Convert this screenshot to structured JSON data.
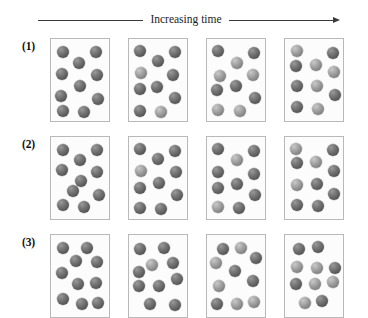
{
  "figure": {
    "time_axis": {
      "label": "Increasing time",
      "arrow_direction": "right"
    },
    "sphere_color_dark": "#5a5a5a",
    "sphere_color_light": "#969696",
    "box_border_color": "#b9b9b9",
    "rows": [
      {
        "label": "(1)",
        "frames": [
          {
            "particle_count": 10,
            "particles": [
              {
                "x": 6,
                "y": 7,
                "shade": "dark"
              },
              {
                "x": 39,
                "y": 7,
                "shade": "dark"
              },
              {
                "x": 22,
                "y": 18,
                "shade": "dark"
              },
              {
                "x": 5,
                "y": 29,
                "shade": "dark"
              },
              {
                "x": 40,
                "y": 30,
                "shade": "dark"
              },
              {
                "x": 23,
                "y": 41,
                "shade": "dark"
              },
              {
                "x": 4,
                "y": 51,
                "shade": "dark"
              },
              {
                "x": 41,
                "y": 54,
                "shade": "dark"
              },
              {
                "x": 6,
                "y": 66,
                "shade": "dark"
              },
              {
                "x": 27,
                "y": 67,
                "shade": "dark"
              }
            ]
          },
          {
            "particle_count": 10,
            "particles": [
              {
                "x": 5,
                "y": 6,
                "shade": "dark"
              },
              {
                "x": 40,
                "y": 7,
                "shade": "dark"
              },
              {
                "x": 23,
                "y": 16,
                "shade": "dark"
              },
              {
                "x": 6,
                "y": 28,
                "shade": "light"
              },
              {
                "x": 38,
                "y": 30,
                "shade": "dark"
              },
              {
                "x": 22,
                "y": 42,
                "shade": "dark"
              },
              {
                "x": 5,
                "y": 44,
                "shade": "dark"
              },
              {
                "x": 40,
                "y": 53,
                "shade": "dark"
              },
              {
                "x": 5,
                "y": 66,
                "shade": "dark"
              },
              {
                "x": 26,
                "y": 67,
                "shade": "light"
              }
            ]
          },
          {
            "particle_count": 10,
            "particles": [
              {
                "x": 5,
                "y": 6,
                "shade": "dark"
              },
              {
                "x": 41,
                "y": 8,
                "shade": "dark"
              },
              {
                "x": 24,
                "y": 18,
                "shade": "light"
              },
              {
                "x": 7,
                "y": 31,
                "shade": "light"
              },
              {
                "x": 40,
                "y": 30,
                "shade": "light"
              },
              {
                "x": 23,
                "y": 41,
                "shade": "dark"
              },
              {
                "x": 4,
                "y": 45,
                "shade": "dark"
              },
              {
                "x": 42,
                "y": 53,
                "shade": "dark"
              },
              {
                "x": 5,
                "y": 65,
                "shade": "light"
              },
              {
                "x": 27,
                "y": 66,
                "shade": "light"
              }
            ]
          },
          {
            "particle_count": 10,
            "particles": [
              {
                "x": 6,
                "y": 6,
                "shade": "light"
              },
              {
                "x": 42,
                "y": 8,
                "shade": "dark"
              },
              {
                "x": 5,
                "y": 21,
                "shade": "dark"
              },
              {
                "x": 25,
                "y": 20,
                "shade": "light"
              },
              {
                "x": 43,
                "y": 27,
                "shade": "light"
              },
              {
                "x": 6,
                "y": 41,
                "shade": "dark"
              },
              {
                "x": 26,
                "y": 41,
                "shade": "light"
              },
              {
                "x": 44,
                "y": 50,
                "shade": "dark"
              },
              {
                "x": 6,
                "y": 62,
                "shade": "dark"
              },
              {
                "x": 27,
                "y": 64,
                "shade": "light"
              }
            ]
          }
        ]
      },
      {
        "label": "(2)",
        "frames": [
          {
            "particle_count": 10,
            "particles": [
              {
                "x": 6,
                "y": 7,
                "shade": "dark"
              },
              {
                "x": 40,
                "y": 7,
                "shade": "dark"
              },
              {
                "x": 23,
                "y": 17,
                "shade": "dark"
              },
              {
                "x": 5,
                "y": 27,
                "shade": "dark"
              },
              {
                "x": 40,
                "y": 29,
                "shade": "dark"
              },
              {
                "x": 24,
                "y": 38,
                "shade": "dark"
              },
              {
                "x": 16,
                "y": 48,
                "shade": "dark"
              },
              {
                "x": 42,
                "y": 52,
                "shade": "dark"
              },
              {
                "x": 6,
                "y": 62,
                "shade": "dark"
              },
              {
                "x": 27,
                "y": 64,
                "shade": "dark"
              }
            ]
          },
          {
            "particle_count": 10,
            "particles": [
              {
                "x": 5,
                "y": 6,
                "shade": "dark"
              },
              {
                "x": 40,
                "y": 8,
                "shade": "dark"
              },
              {
                "x": 23,
                "y": 16,
                "shade": "dark"
              },
              {
                "x": 6,
                "y": 28,
                "shade": "light"
              },
              {
                "x": 41,
                "y": 29,
                "shade": "dark"
              },
              {
                "x": 24,
                "y": 40,
                "shade": "dark"
              },
              {
                "x": 5,
                "y": 45,
                "shade": "dark"
              },
              {
                "x": 42,
                "y": 52,
                "shade": "dark"
              },
              {
                "x": 5,
                "y": 65,
                "shade": "dark"
              },
              {
                "x": 26,
                "y": 66,
                "shade": "dark"
              }
            ]
          },
          {
            "particle_count": 10,
            "particles": [
              {
                "x": 5,
                "y": 6,
                "shade": "dark"
              },
              {
                "x": 41,
                "y": 8,
                "shade": "dark"
              },
              {
                "x": 24,
                "y": 17,
                "shade": "light"
              },
              {
                "x": 5,
                "y": 29,
                "shade": "dark"
              },
              {
                "x": 41,
                "y": 31,
                "shade": "dark"
              },
              {
                "x": 24,
                "y": 41,
                "shade": "dark"
              },
              {
                "x": 5,
                "y": 45,
                "shade": "dark"
              },
              {
                "x": 42,
                "y": 52,
                "shade": "dark"
              },
              {
                "x": 5,
                "y": 64,
                "shade": "light"
              },
              {
                "x": 26,
                "y": 65,
                "shade": "dark"
              }
            ]
          },
          {
            "particle_count": 10,
            "particles": [
              {
                "x": 5,
                "y": 6,
                "shade": "light"
              },
              {
                "x": 42,
                "y": 7,
                "shade": "dark"
              },
              {
                "x": 6,
                "y": 20,
                "shade": "dark"
              },
              {
                "x": 25,
                "y": 19,
                "shade": "light"
              },
              {
                "x": 43,
                "y": 28,
                "shade": "dark"
              },
              {
                "x": 6,
                "y": 42,
                "shade": "light"
              },
              {
                "x": 26,
                "y": 41,
                "shade": "dark"
              },
              {
                "x": 43,
                "y": 51,
                "shade": "dark"
              },
              {
                "x": 6,
                "y": 62,
                "shade": "dark"
              },
              {
                "x": 27,
                "y": 63,
                "shade": "dark"
              }
            ]
          }
        ]
      },
      {
        "label": "(3)",
        "frames": [
          {
            "particle_count": 10,
            "particles": [
              {
                "x": 6,
                "y": 7,
                "shade": "dark"
              },
              {
                "x": 30,
                "y": 7,
                "shade": "dark"
              },
              {
                "x": 19,
                "y": 20,
                "shade": "dark"
              },
              {
                "x": 40,
                "y": 21,
                "shade": "dark"
              },
              {
                "x": 5,
                "y": 32,
                "shade": "dark"
              },
              {
                "x": 21,
                "y": 43,
                "shade": "dark"
              },
              {
                "x": 39,
                "y": 42,
                "shade": "dark"
              },
              {
                "x": 6,
                "y": 58,
                "shade": "dark"
              },
              {
                "x": 25,
                "y": 63,
                "shade": "dark"
              },
              {
                "x": 41,
                "y": 62,
                "shade": "dark"
              }
            ]
          },
          {
            "particle_count": 10,
            "particles": [
              {
                "x": 5,
                "y": 8,
                "shade": "dark"
              },
              {
                "x": 29,
                "y": 7,
                "shade": "dark"
              },
              {
                "x": 17,
                "y": 24,
                "shade": "light"
              },
              {
                "x": 38,
                "y": 22,
                "shade": "dark"
              },
              {
                "x": 4,
                "y": 31,
                "shade": "dark"
              },
              {
                "x": 42,
                "y": 38,
                "shade": "dark"
              },
              {
                "x": 4,
                "y": 45,
                "shade": "dark"
              },
              {
                "x": 24,
                "y": 45,
                "shade": "dark"
              },
              {
                "x": 15,
                "y": 63,
                "shade": "dark"
              },
              {
                "x": 40,
                "y": 64,
                "shade": "dark"
              }
            ]
          },
          {
            "particle_count": 10,
            "particles": [
              {
                "x": 10,
                "y": 8,
                "shade": "dark"
              },
              {
                "x": 28,
                "y": 7,
                "shade": "light"
              },
              {
                "x": 43,
                "y": 17,
                "shade": "dark"
              },
              {
                "x": 3,
                "y": 22,
                "shade": "light"
              },
              {
                "x": 22,
                "y": 30,
                "shade": "dark"
              },
              {
                "x": 40,
                "y": 40,
                "shade": "dark"
              },
              {
                "x": 6,
                "y": 45,
                "shade": "light"
              },
              {
                "x": 4,
                "y": 63,
                "shade": "dark"
              },
              {
                "x": 24,
                "y": 63,
                "shade": "light"
              },
              {
                "x": 41,
                "y": 61,
                "shade": "light"
              }
            ]
          },
          {
            "particle_count": 10,
            "particles": [
              {
                "x": 8,
                "y": 8,
                "shade": "dark"
              },
              {
                "x": 27,
                "y": 6,
                "shade": "dark"
              },
              {
                "x": 6,
                "y": 26,
                "shade": "light"
              },
              {
                "x": 26,
                "y": 27,
                "shade": "light"
              },
              {
                "x": 44,
                "y": 27,
                "shade": "dark"
              },
              {
                "x": 5,
                "y": 43,
                "shade": "dark"
              },
              {
                "x": 24,
                "y": 43,
                "shade": "light"
              },
              {
                "x": 42,
                "y": 41,
                "shade": "light"
              },
              {
                "x": 14,
                "y": 62,
                "shade": "light"
              },
              {
                "x": 31,
                "y": 60,
                "shade": "dark"
              }
            ]
          }
        ]
      }
    ]
  }
}
